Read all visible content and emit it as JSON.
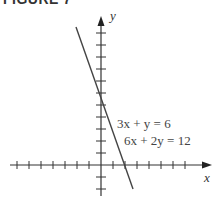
{
  "figure": {
    "label": "FIGURE 7"
  },
  "graph": {
    "x_axis_label": "x",
    "y_axis_label": "y",
    "equations": [
      "3x + y = 6",
      "6x + 2y = 12"
    ],
    "line": {
      "slope": -3,
      "y_intercept": 6,
      "x_intercept": 2
    },
    "x_ticks": [
      -7,
      -6,
      -5,
      -4,
      -3,
      -2,
      -1,
      1,
      2,
      3,
      4,
      5,
      6,
      7
    ],
    "y_ticks": [
      -2,
      -1,
      1,
      2,
      3,
      4,
      5,
      6,
      7,
      8,
      9,
      10
    ],
    "colors": {
      "axis": "#333333",
      "line": "#444444",
      "text": "#444444"
    }
  }
}
